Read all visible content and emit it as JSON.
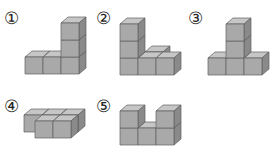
{
  "figures": [
    {
      "id": 1,
      "label": "1",
      "label_glyph": "①",
      "description": "L-shape: 3 cubes in a row, right cube stacked 3 high",
      "cubes": [
        [
          0,
          0,
          0
        ],
        [
          1,
          0,
          0
        ],
        [
          2,
          0,
          0
        ],
        [
          2,
          0,
          1
        ],
        [
          2,
          0,
          2
        ]
      ]
    },
    {
      "id": 2,
      "label": "2",
      "label_glyph": "②",
      "description": "Left column 3 high with front row of 3 and one cube behind middle",
      "cubes": [
        [
          0,
          0,
          0
        ],
        [
          0,
          0,
          1
        ],
        [
          0,
          0,
          2
        ],
        [
          1,
          1,
          0
        ],
        [
          1,
          0,
          0
        ],
        [
          2,
          0,
          0
        ]
      ]
    },
    {
      "id": 3,
      "label": "3",
      "label_glyph": "③",
      "description": "T-shape: 3 cubes in a row, middle stacked 3 high",
      "cubes": [
        [
          0,
          0,
          0
        ],
        [
          1,
          0,
          0
        ],
        [
          2,
          0,
          0
        ],
        [
          1,
          0,
          1
        ],
        [
          1,
          0,
          2
        ]
      ]
    },
    {
      "id": 4,
      "label": "4",
      "label_glyph": "④",
      "description": "Flat: back row of 3 cubes, front row of 2 cubes (right aligned)",
      "cubes": [
        [
          0,
          1,
          0
        ],
        [
          1,
          1,
          0
        ],
        [
          2,
          1,
          0
        ],
        [
          1,
          0,
          0
        ],
        [
          2,
          0,
          0
        ]
      ]
    },
    {
      "id": 5,
      "label": "5",
      "label_glyph": "⑤",
      "description": "U-shape: 3 cubes in a row, left and right stacked 2 high",
      "cubes": [
        [
          0,
          0,
          0
        ],
        [
          1,
          0,
          0
        ],
        [
          2,
          0,
          0
        ],
        [
          0,
          0,
          1
        ],
        [
          2,
          0,
          1
        ]
      ]
    }
  ],
  "colors": {
    "front": "#a9a9a9",
    "top": "#c6c6c6",
    "side": "#8a8a8a",
    "edge": "#5e5e5e"
  }
}
